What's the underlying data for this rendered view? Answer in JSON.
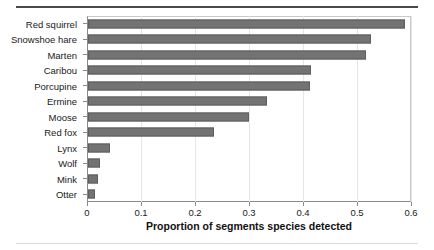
{
  "chart_data": {
    "type": "bar",
    "orientation": "horizontal",
    "title": "",
    "subtitle": "",
    "xlabel": "Proportion of segments species detected",
    "ylabel": "",
    "categories": [
      "Red squirrel",
      "Snowshoe hare",
      "Marten",
      "Caribou",
      "Porcupine",
      "Ermine",
      "Moose",
      "Red fox",
      "Lynx",
      "Wolf",
      "Mink",
      "Otter"
    ],
    "values": [
      0.587,
      0.524,
      0.515,
      0.413,
      0.411,
      0.331,
      0.298,
      0.233,
      0.04,
      0.022,
      0.019,
      0.013
    ],
    "xlim": [
      0,
      0.6
    ],
    "xticks": [
      0,
      0.1,
      0.2,
      0.3,
      0.4,
      0.5,
      0.6
    ],
    "xtick_labels": [
      "0",
      "0.1",
      "0.2",
      "0.3",
      "0.4",
      "0.5",
      "0.6"
    ],
    "grid": "vertical",
    "legend": "none",
    "bar_color": "#737373",
    "bar_edge_color": "#5e5e5e",
    "gridline_color": "#e6e6e6",
    "axis_color": "#8a8a8a",
    "background": "#ffffff"
  }
}
